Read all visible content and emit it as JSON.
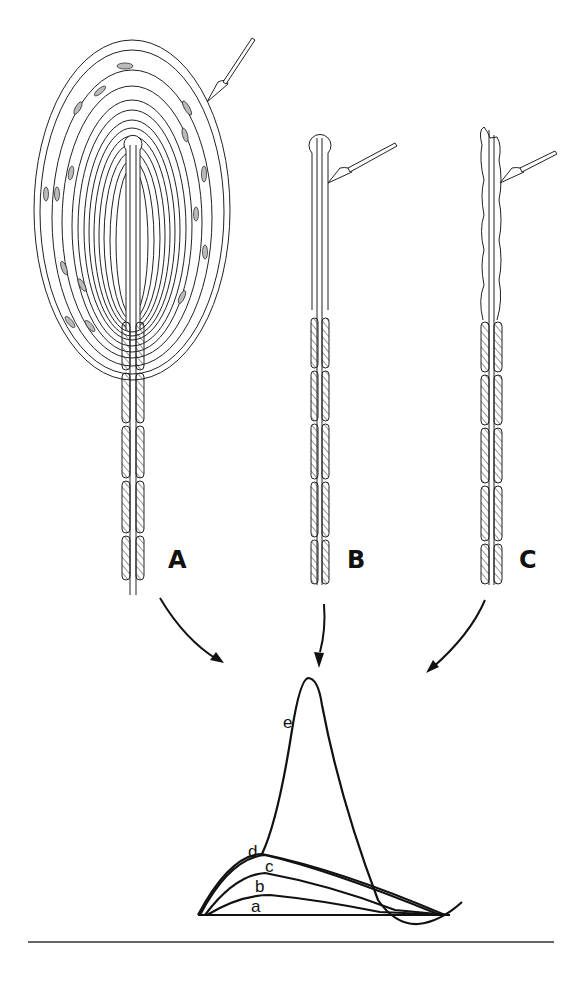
{
  "figure": {
    "panels": [
      {
        "id": "A",
        "label": "A",
        "description": "Intact lamellated corpuscle with concentric capsule layers, stimulated by probe"
      },
      {
        "id": "B",
        "label": "B",
        "description": "Decapsulated nerve ending with bulbous tip, stimulated by probe"
      },
      {
        "id": "C",
        "label": "C",
        "description": "Damaged/irregular nerve terminal, stimulated by probe"
      }
    ],
    "response_plot": {
      "curve_labels": [
        "a",
        "b",
        "c",
        "d",
        "e"
      ],
      "description": "Graded receptor potentials a–d and spike e over a baseline"
    }
  },
  "colors": {
    "ink": "#111111",
    "background": "#ffffff"
  }
}
